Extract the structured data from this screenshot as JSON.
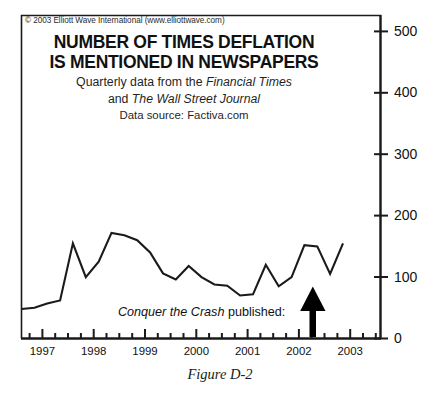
{
  "figure": {
    "caption": "Figure D-2",
    "copyright": "© 2003 Elliott Wave International (www.elliottwave.com)"
  },
  "titles": {
    "line1": "NUMBER OF TIMES DEFLATION",
    "line2": "IS MENTIONED IN NEWSPAPERS",
    "sub1_prefix": "Quarterly data from the ",
    "sub1_italic": "Financial Times",
    "sub2_prefix": "and ",
    "sub2_italic": "The Wall Street Journal",
    "sub3": "Data source: Factiva.com"
  },
  "annotation": {
    "italic_part": "Conquer the Crash",
    "plain_part": " published:",
    "marker": "up-arrow"
  },
  "colors": {
    "line": "#1a1a1a",
    "axis": "#1a1a1a",
    "frame": "#1a1a1a",
    "background": "#ffffff",
    "arrow": "#000000"
  },
  "chart_data": {
    "type": "line",
    "title": "NUMBER OF TIMES DEFLATION IS MENTIONED IN NEWSPAPERS",
    "subtitle": "Quarterly data from the Financial Times and The Wall Street Journal",
    "source": "Data source: Factiva.com",
    "xlabel": "",
    "ylabel": "",
    "xlim": [
      1996.75,
      2003.0
    ],
    "ylim": [
      0,
      500
    ],
    "yticks": [
      0,
      100,
      200,
      300,
      400,
      500
    ],
    "ytick_labels": [
      "0",
      "100",
      "200",
      "300",
      "400",
      "500"
    ],
    "xticks": [
      1997,
      1998,
      1999,
      2000,
      2001,
      2002,
      2003
    ],
    "xtick_labels": [
      "1997",
      "1998",
      "1999",
      "2000",
      "2001",
      "2002",
      "2003"
    ],
    "minor_tick_interval_years": 0.25,
    "grid": false,
    "legend": false,
    "x": [
      1996.75,
      1997.0,
      1997.25,
      1997.5,
      1997.75,
      1998.0,
      1998.25,
      1998.5,
      1998.75,
      1999.0,
      1999.25,
      1999.5,
      1999.75,
      2000.0,
      2000.25,
      2000.5,
      2000.75,
      2001.0,
      2001.25,
      2001.5,
      2001.75,
      2002.0,
      2002.25,
      2002.5,
      2002.75,
      2003.0
    ],
    "values": [
      48,
      50,
      57,
      62,
      155,
      100,
      125,
      172,
      168,
      160,
      140,
      106,
      96,
      118,
      100,
      88,
      86,
      70,
      72,
      120,
      85,
      100,
      152,
      150,
      105,
      155
    ],
    "series": [
      {
        "name": "Mentions of deflation (quarterly)",
        "values": [
          48,
          50,
          57,
          62,
          155,
          100,
          125,
          172,
          168,
          160,
          140,
          106,
          96,
          118,
          100,
          88,
          86,
          70,
          72,
          120,
          85,
          100,
          152,
          150,
          105,
          155
        ]
      }
    ],
    "annotations": [
      {
        "text": "Conquer the Crash published:",
        "x": 2001.75,
        "type": "arrow-up"
      }
    ]
  }
}
